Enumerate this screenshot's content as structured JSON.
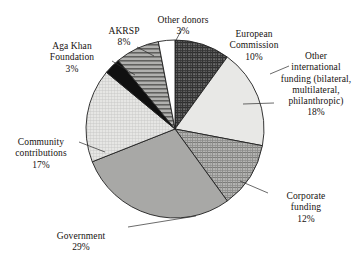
{
  "chart_data": {
    "type": "pie",
    "title": "",
    "subtitle": "",
    "xlabel": "",
    "ylabel": "",
    "legend_position": "none",
    "grid": false,
    "units": "percent",
    "total": 100,
    "categories": [
      "European Commission",
      "Other international funding (bilateral, multilateral, philanthropic)",
      "Corporate funding",
      "Government",
      "Community contributions",
      "Aga Khan Foundation",
      "AKRSP",
      "Other donors"
    ],
    "values": [
      10,
      18,
      12,
      29,
      17,
      3,
      8,
      3
    ],
    "slices": [
      {
        "id": "european-commission",
        "label": "European\nCommission",
        "label_plain": "European Commission",
        "percent_text": "10%",
        "value": 10,
        "fill_style": "dark-crosshatch",
        "color": "#5a5a5a"
      },
      {
        "id": "other-international-funding",
        "label": "Other\ninternational\nfunding (bilateral,\nmultilateral,\nphilanthropic)",
        "label_plain": "Other international funding (bilateral, multilateral, philanthropic)",
        "percent_text": "18%",
        "value": 18,
        "fill_style": "solid-very-light",
        "color": "#e4e4e2"
      },
      {
        "id": "corporate-funding",
        "label": "Corporate\nfunding",
        "label_plain": "Corporate funding",
        "percent_text": "12%",
        "value": 12,
        "fill_style": "medium-crosshatch",
        "color": "#9a9a9a"
      },
      {
        "id": "government",
        "label": "Government",
        "label_plain": "Government",
        "percent_text": "29%",
        "value": 29,
        "fill_style": "solid-medium-grey",
        "color": "#a6a6a6"
      },
      {
        "id": "community-contributions",
        "label": "Community\ncontributions",
        "label_plain": "Community contributions",
        "percent_text": "17%",
        "value": 17,
        "fill_style": "light-fine-grid",
        "color": "#d8d8d6"
      },
      {
        "id": "aga-khan-foundation",
        "label": "Aga Khan\nFoundation",
        "label_plain": "Aga Khan Foundation",
        "percent_text": "3%",
        "value": 3,
        "fill_style": "solid-black",
        "color": "#0d0d0d"
      },
      {
        "id": "akrsp",
        "label": "AKRSP",
        "label_plain": "AKRSP",
        "percent_text": "8%",
        "value": 8,
        "fill_style": "horizontal-lines",
        "color": "#8f8f8f"
      },
      {
        "id": "other-donors",
        "label": "Other donors",
        "label_plain": "Other donors",
        "percent_text": "3%",
        "value": 3,
        "fill_style": "white",
        "color": "#ffffff"
      }
    ]
  }
}
